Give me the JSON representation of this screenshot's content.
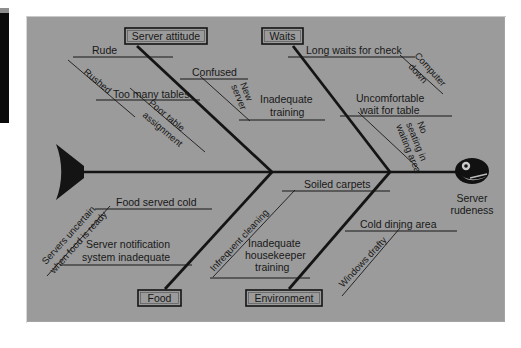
{
  "diagram": {
    "type": "fishbone-ishikawa",
    "effect_label": "Server rudeness",
    "categories_top": [
      {
        "name": "Server attitude",
        "box_label": "Server attitude"
      },
      {
        "name": "Waits",
        "box_label": "Waits"
      }
    ],
    "categories_bottom": [
      {
        "name": "Food",
        "box_label": "Food"
      },
      {
        "name": "Environment",
        "box_label": "Environment"
      }
    ],
    "causes": {
      "server_attitude": [
        {
          "label": "Rude",
          "subcauses": [
            "Rushed"
          ]
        },
        {
          "label": "Too many tables",
          "subcauses": [
            "Poor table assignment"
          ]
        },
        {
          "label": "Confused",
          "subcauses": [
            "New server"
          ]
        },
        {
          "label": "Inadequate training",
          "subcauses": []
        }
      ],
      "waits": [
        {
          "label": "Long waits for check",
          "subcauses": [
            "Computer down"
          ]
        },
        {
          "label": "Uncomfortable wait for table",
          "subcauses": [
            "No seating in waiting area"
          ]
        }
      ],
      "food": [
        {
          "label": "Food served cold",
          "subcauses": [
            "Servers uncertain when food is ready"
          ]
        },
        {
          "label": "Server notification system inadequate",
          "subcauses": []
        }
      ],
      "environment": [
        {
          "label": "Soiled carpets",
          "subcauses": [
            "Infrequent cleaning"
          ]
        },
        {
          "label": "Inadequate housekeeper training",
          "subcauses": []
        },
        {
          "label": "Cold dining area",
          "subcauses": [
            "Windows drafty"
          ]
        }
      ]
    },
    "labels": {
      "rude": "Rude",
      "rushed": "Rushed",
      "too_many_tables": "Too many tables",
      "poor_table_line1": "Poor table",
      "poor_table_line2": "assignment",
      "confused": "Confused",
      "new_server_line1": "New",
      "new_server_line2": "server",
      "inadequate_training_line1": "Inadequate",
      "inadequate_training_line2": "training",
      "long_waits": "Long waits for check",
      "computer_line1": "Computer",
      "computer_line2": "down",
      "uncomfortable_line1": "Uncomfortable",
      "uncomfortable_line2": "wait for table",
      "no_seating_line1": "No",
      "no_seating_line2": "seating in",
      "no_seating_line3": "waiting area",
      "food_served_cold": "Food served cold",
      "servers_uncertain_line1": "Servers uncertain",
      "servers_uncertain_line2": "when food is ready",
      "server_notif_line1": "Server notification",
      "server_notif_line2": "system inadequate",
      "soiled_carpets": "Soiled carpets",
      "infrequent_cleaning": "Infrequent cleaning",
      "inadequate_hk_line1": "Inadequate",
      "inadequate_hk_line2": "housekeeper",
      "inadequate_hk_line3": "training",
      "cold_dining_area": "Cold dining area",
      "windows_drafty": "Windows drafty",
      "box_server_attitude": "Server attitude",
      "box_waits": "Waits",
      "box_food": "Food",
      "box_environment": "Environment",
      "effect_line1": "Server",
      "effect_line2": "rudeness"
    },
    "colors": {
      "panel_background": "#9b9b9b",
      "line": "#141414",
      "text": "#181818",
      "page_background": "#ffffff",
      "scan_artifact": "#0b0b0b"
    },
    "icons": {
      "fish_head": "fish-head-icon",
      "fish_tail": "fish-tail-icon"
    }
  }
}
